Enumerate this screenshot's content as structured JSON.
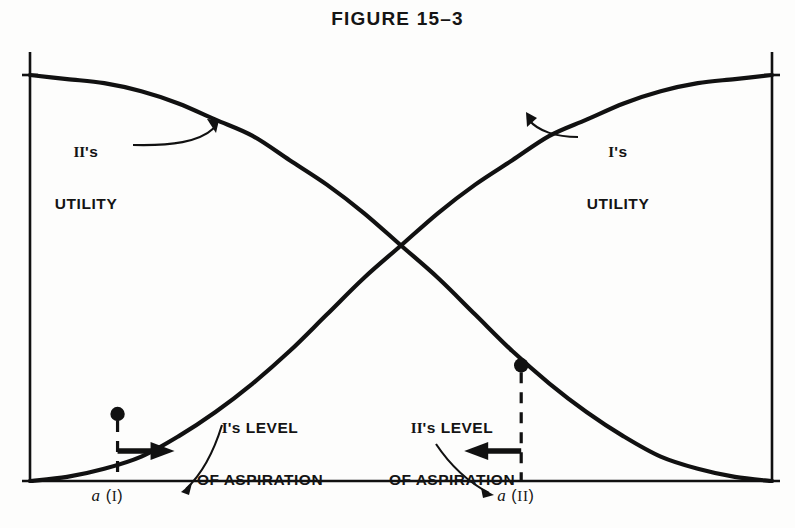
{
  "figure": {
    "title": "FIGURE 15–3",
    "background_color": "#fdfdfc",
    "ink_color": "#111111"
  },
  "labels": {
    "player_two_utility": "II's\nUTILITY",
    "player_one_utility": "I's\nUTILITY",
    "player_one_aspiration": "I's LEVEL\nOF ASPIRATION",
    "player_two_aspiration": "II's LEVEL\nOF ASPIRATION",
    "a_one": "a (I)",
    "a_two": "a (II)"
  },
  "chart_data": {
    "type": "line",
    "title": "FIGURE 15–3",
    "xlabel": "",
    "ylabel": "",
    "xlim": [
      0,
      1
    ],
    "ylim": [
      0,
      1
    ],
    "grid": false,
    "legend_position": "inline-annotations",
    "series": [
      {
        "name": "I's UTILITY",
        "description": "Monotonically increasing utility of player I as the settlement point moves right along the axis.",
        "x": [
          0.0,
          0.05,
          0.1,
          0.15,
          0.2,
          0.25,
          0.3,
          0.35,
          0.4,
          0.45,
          0.5,
          0.55,
          0.6,
          0.65,
          0.7,
          0.75,
          0.8,
          0.85,
          0.9,
          0.95,
          1.0
        ],
        "y": [
          0.0,
          0.01,
          0.03,
          0.06,
          0.11,
          0.17,
          0.24,
          0.32,
          0.41,
          0.5,
          0.58,
          0.66,
          0.73,
          0.79,
          0.85,
          0.89,
          0.93,
          0.96,
          0.98,
          0.99,
          1.0
        ]
      },
      {
        "name": "II's UTILITY",
        "description": "Monotonically decreasing utility of player II as the settlement point moves right along the axis.",
        "x": [
          0.0,
          0.05,
          0.1,
          0.15,
          0.2,
          0.25,
          0.3,
          0.35,
          0.4,
          0.45,
          0.5,
          0.55,
          0.6,
          0.65,
          0.7,
          0.75,
          0.8,
          0.85,
          0.9,
          0.95,
          1.0
        ],
        "y": [
          1.0,
          0.99,
          0.98,
          0.96,
          0.93,
          0.89,
          0.85,
          0.79,
          0.73,
          0.66,
          0.58,
          0.5,
          0.41,
          0.32,
          0.24,
          0.17,
          0.11,
          0.06,
          0.03,
          0.01,
          0.0
        ]
      }
    ],
    "annotations": [
      {
        "name": "crossing-point",
        "x": 0.5,
        "y": 0.58,
        "label": ""
      },
      {
        "name": "a(I)",
        "label": "a (I)",
        "x": 0.118,
        "y_on_curve": 0.165,
        "direction": "right",
        "meaning": "I's level of aspiration; I prefers outcomes to the right of a(I)."
      },
      {
        "name": "a(II)",
        "label": "a (II)",
        "x": 0.662,
        "y_on_curve": 0.285,
        "direction": "left",
        "meaning": "II's level of aspiration; II prefers outcomes to the left of a(II)."
      }
    ]
  }
}
